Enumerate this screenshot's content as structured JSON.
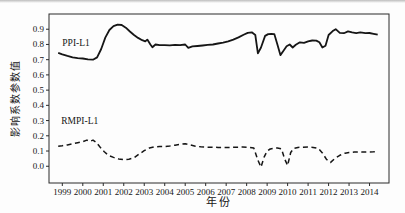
{
  "figure": {
    "background": "#fdfdfd",
    "line_color": "#161616"
  },
  "chart_data": {
    "type": "line",
    "title": "",
    "xlabel": "年份",
    "ylabel": "影响系数参数值",
    "grid": false,
    "legend_position": "inline-annotations",
    "xlim": [
      1998.35,
      2014.95
    ],
    "ylim": [
      -0.11,
      1.0
    ],
    "x_ticks": [
      1999,
      2000,
      2001,
      2002,
      2003,
      2004,
      2005,
      2006,
      2007,
      2008,
      2009,
      2010,
      2011,
      2012,
      2013,
      2014
    ],
    "y_ticks": [
      0.0,
      0.1,
      0.2,
      0.3,
      0.4,
      0.5,
      0.6,
      0.7,
      0.8,
      0.9
    ],
    "annotations": [
      {
        "text": "PPI-L1",
        "x": 1999.0,
        "y": 0.81
      },
      {
        "text": "RMPI-L1",
        "x": 1998.95,
        "y": 0.3
      }
    ],
    "series": [
      {
        "name": "PPI-L1",
        "style": "solid",
        "x": [
          1998.8,
          1999.0,
          1999.25,
          1999.5,
          1999.75,
          2000.0,
          2000.25,
          2000.5,
          2000.7,
          2000.9,
          2001.1,
          2001.3,
          2001.5,
          2001.7,
          2001.9,
          2002.1,
          2002.3,
          2002.5,
          2002.7,
          2002.9,
          2003.05,
          2003.15,
          2003.3,
          2003.4,
          2003.55,
          2003.75,
          2004.0,
          2004.25,
          2004.5,
          2004.75,
          2005.0,
          2005.15,
          2005.35,
          2005.6,
          2005.85,
          2006.1,
          2006.35,
          2006.6,
          2006.85,
          2007.1,
          2007.35,
          2007.6,
          2007.85,
          2008.05,
          2008.25,
          2008.42,
          2008.55,
          2008.7,
          2008.9,
          2009.05,
          2009.2,
          2009.35,
          2009.5,
          2009.65,
          2009.8,
          2009.95,
          2010.1,
          2010.25,
          2010.4,
          2010.6,
          2010.8,
          2011.0,
          2011.2,
          2011.4,
          2011.55,
          2011.7,
          2011.85,
          2012.0,
          2012.2,
          2012.35,
          2012.55,
          2012.75,
          2012.95,
          2013.15,
          2013.35,
          2013.55,
          2013.8,
          2014.0,
          2014.2,
          2014.4
        ],
        "y": [
          0.745,
          0.735,
          0.725,
          0.715,
          0.71,
          0.708,
          0.702,
          0.7,
          0.715,
          0.77,
          0.845,
          0.895,
          0.92,
          0.93,
          0.928,
          0.91,
          0.885,
          0.862,
          0.843,
          0.828,
          0.82,
          0.832,
          0.8,
          0.782,
          0.8,
          0.795,
          0.795,
          0.794,
          0.798,
          0.795,
          0.8,
          0.778,
          0.787,
          0.79,
          0.793,
          0.797,
          0.8,
          0.806,
          0.812,
          0.82,
          0.832,
          0.846,
          0.864,
          0.876,
          0.88,
          0.862,
          0.742,
          0.78,
          0.856,
          0.868,
          0.87,
          0.868,
          0.8,
          0.73,
          0.758,
          0.788,
          0.8,
          0.78,
          0.798,
          0.814,
          0.81,
          0.82,
          0.826,
          0.825,
          0.814,
          0.78,
          0.792,
          0.862,
          0.888,
          0.9,
          0.876,
          0.874,
          0.886,
          0.879,
          0.874,
          0.879,
          0.874,
          0.875,
          0.87,
          0.864
        ]
      },
      {
        "name": "RMPI-L1",
        "style": "dashed",
        "x": [
          1998.8,
          1999.0,
          1999.25,
          1999.5,
          1999.75,
          2000.0,
          2000.2,
          2000.35,
          2000.5,
          2000.65,
          2000.85,
          2001.05,
          2001.25,
          2001.5,
          2001.75,
          2002.0,
          2002.25,
          2002.5,
          2002.75,
          2003.0,
          2003.25,
          2003.5,
          2003.75,
          2004.0,
          2004.25,
          2004.5,
          2004.75,
          2005.0,
          2005.25,
          2005.5,
          2005.75,
          2006.0,
          2006.3,
          2006.6,
          2006.9,
          2007.2,
          2007.5,
          2007.8,
          2008.1,
          2008.35,
          2008.55,
          2008.7,
          2008.85,
          2009.0,
          2009.15,
          2009.3,
          2009.5,
          2009.7,
          2009.85,
          2010.0,
          2010.15,
          2010.3,
          2010.5,
          2010.75,
          2011.0,
          2011.25,
          2011.5,
          2011.7,
          2011.9,
          2012.1,
          2012.3,
          2012.55,
          2012.8,
          2013.0,
          2013.25,
          2013.5,
          2013.75,
          2014.0,
          2014.2,
          2014.4
        ],
        "y": [
          0.132,
          0.135,
          0.14,
          0.148,
          0.155,
          0.162,
          0.172,
          0.163,
          0.172,
          0.158,
          0.125,
          0.095,
          0.072,
          0.058,
          0.048,
          0.044,
          0.046,
          0.055,
          0.08,
          0.102,
          0.12,
          0.128,
          0.13,
          0.13,
          0.133,
          0.138,
          0.144,
          0.148,
          0.14,
          0.132,
          0.128,
          0.126,
          0.125,
          0.124,
          0.124,
          0.124,
          0.125,
          0.126,
          0.125,
          0.12,
          0.04,
          -0.005,
          0.06,
          0.1,
          0.113,
          0.118,
          0.12,
          0.114,
          0.05,
          0.005,
          0.09,
          0.118,
          0.124,
          0.125,
          0.126,
          0.124,
          0.117,
          0.088,
          0.045,
          0.025,
          0.05,
          0.072,
          0.086,
          0.09,
          0.093,
          0.095,
          0.093,
          0.094,
          0.095,
          0.096
        ]
      }
    ]
  }
}
